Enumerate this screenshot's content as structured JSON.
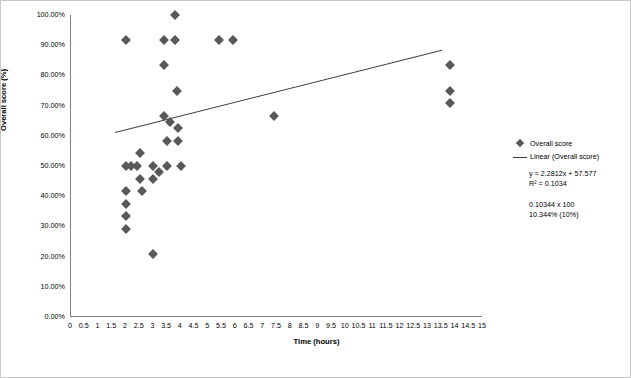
{
  "chart_data": {
    "type": "scatter",
    "title": "",
    "xlabel": "Time (hours)",
    "ylabel": "Overall score (%)",
    "xlim": [
      0,
      15
    ],
    "ylim": [
      0,
      100
    ],
    "xticks": [
      "0",
      "0.5",
      "1",
      "1.5",
      "2",
      "2.5",
      "3",
      "3.5",
      "4",
      "4.5",
      "5",
      "5.5",
      "6",
      "6.5",
      "7",
      "7.5",
      "8",
      "8.5",
      "9",
      "9.5",
      "10",
      "10.5",
      "11",
      "11.5",
      "12",
      "12.5",
      "13",
      "13.5",
      "14",
      "14.5",
      "15"
    ],
    "yticks": [
      "0.00%",
      "10.00%",
      "20.00%",
      "30.00%",
      "40.00%",
      "50.00%",
      "60.00%",
      "70.00%",
      "80.00%",
      "90.00%",
      "100.00%"
    ],
    "grid": false,
    "legend_position": "right",
    "series": [
      {
        "name": "Overall score",
        "type": "scatter",
        "marker": "diamond",
        "color": "#595959",
        "points": [
          [
            2.0,
            91.7
          ],
          [
            2.0,
            50.0
          ],
          [
            2.0,
            41.7
          ],
          [
            2.0,
            37.5
          ],
          [
            2.0,
            33.3
          ],
          [
            2.0,
            29.2
          ],
          [
            2.2,
            50.0
          ],
          [
            2.4,
            50.0
          ],
          [
            2.5,
            54.2
          ],
          [
            2.5,
            45.8
          ],
          [
            2.6,
            41.7
          ],
          [
            3.0,
            50.0
          ],
          [
            3.0,
            45.8
          ],
          [
            3.0,
            20.8
          ],
          [
            3.2,
            47.9
          ],
          [
            3.4,
            66.7
          ],
          [
            3.4,
            91.7
          ],
          [
            3.4,
            83.3
          ],
          [
            3.5,
            58.3
          ],
          [
            3.5,
            50.0
          ],
          [
            3.6,
            64.6
          ],
          [
            3.8,
            100.0
          ],
          [
            3.8,
            91.7
          ],
          [
            3.85,
            75.0
          ],
          [
            3.9,
            62.5
          ],
          [
            3.9,
            58.3
          ],
          [
            4.0,
            50.0
          ],
          [
            5.4,
            91.7
          ],
          [
            5.9,
            91.7
          ],
          [
            7.4,
            66.7
          ],
          [
            13.8,
            83.3
          ],
          [
            13.8,
            75.0
          ],
          [
            13.8,
            70.8
          ]
        ]
      },
      {
        "name": "Linear (Overall score)",
        "type": "line",
        "color": "#404040",
        "equation": "y = 2.2812x + 57.577",
        "r2": "R² = 0.1034",
        "x": [
          1.6,
          13.5
        ],
        "y": [
          61.2,
          88.4
        ]
      }
    ],
    "annotations": [
      "y = 2.2812x + 57.577",
      "R² = 0.1034",
      "0.10344 x 100",
      "10.344% (10%)"
    ]
  },
  "legend": {
    "entries": [
      {
        "label": "Overall score",
        "marker": "diamond"
      },
      {
        "label": "Linear (Overall score)",
        "marker": "line"
      }
    ]
  },
  "equation_lines": [
    "y = 2.2812x + 57.577",
    "R² = 0.1034"
  ],
  "note_lines": [
    "0.10344 x 100",
    "10.344% (10%)"
  ]
}
